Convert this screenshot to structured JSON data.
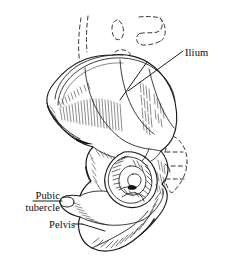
{
  "figure": {
    "style": "pen-and-ink hatched medical illustration",
    "background_color": "#ffffff",
    "ink_color": "#111111",
    "width": 226,
    "height": 270
  },
  "labels": {
    "ilium": "Ilium",
    "pubic_tubercle_line1": "Pubic",
    "pubic_tubercle_line2": "tubercle",
    "pelvis": "Pelvis"
  },
  "structures": [
    {
      "name": "ilium",
      "description": "iliac wing, large fan-shaped upper blade with crest"
    },
    {
      "name": "acetabulum",
      "description": "deep circular hip socket, heavily shaded"
    },
    {
      "name": "pubic-tubercle",
      "description": "small bony prominence on superior pubic ramus, left"
    },
    {
      "name": "obturator-foramen",
      "description": "large opening below the acetabulum"
    },
    {
      "name": "ischium",
      "description": "lower posterior portion of the pelvic bone"
    },
    {
      "name": "sacrum-ghost",
      "description": "dashed ghost outline of sacrum and vertebrae above and right"
    }
  ]
}
